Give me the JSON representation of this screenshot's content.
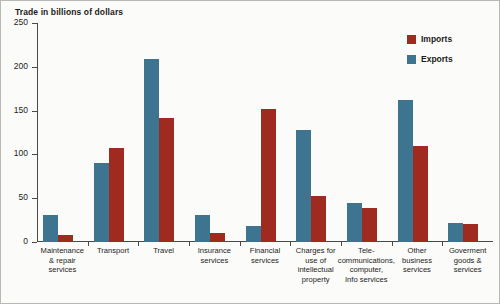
{
  "chart_data": {
    "type": "bar",
    "title": "Trade in billions of dollars",
    "xlabel": "",
    "ylabel": "",
    "ylim": [
      0,
      250
    ],
    "yticks": [
      0,
      50,
      100,
      150,
      200,
      250
    ],
    "grid": false,
    "legend_position": "top-right",
    "categories": [
      "Maintenance & repair services",
      "Transport",
      "Travel",
      "Insurance services",
      "Financial services",
      "Charges for use of intellectual property",
      "Tele-communications, computer, Info services",
      "Other business services",
      "Goverment goods & services"
    ],
    "category_lines": [
      [
        "Maintenance",
        "& repair",
        "services"
      ],
      [
        "Transport"
      ],
      [
        "Travel"
      ],
      [
        "Insurance",
        "services"
      ],
      [
        "Financial",
        "services"
      ],
      [
        "Charges for",
        "use of",
        "intellectual",
        "property"
      ],
      [
        "Tele-",
        "communications,",
        "computer,",
        "Info services"
      ],
      [
        "Other",
        "business",
        "services"
      ],
      [
        "Goverment",
        "goods &",
        "services"
      ]
    ],
    "series": [
      {
        "name": "Imports",
        "color": "#9e2a20",
        "values": [
          8,
          107,
          141,
          10,
          152,
          53,
          39,
          110,
          21
        ]
      },
      {
        "name": "Exports",
        "color": "#3d7490",
        "values": [
          31,
          90,
          209,
          31,
          18,
          128,
          44,
          162,
          22
        ]
      }
    ]
  }
}
